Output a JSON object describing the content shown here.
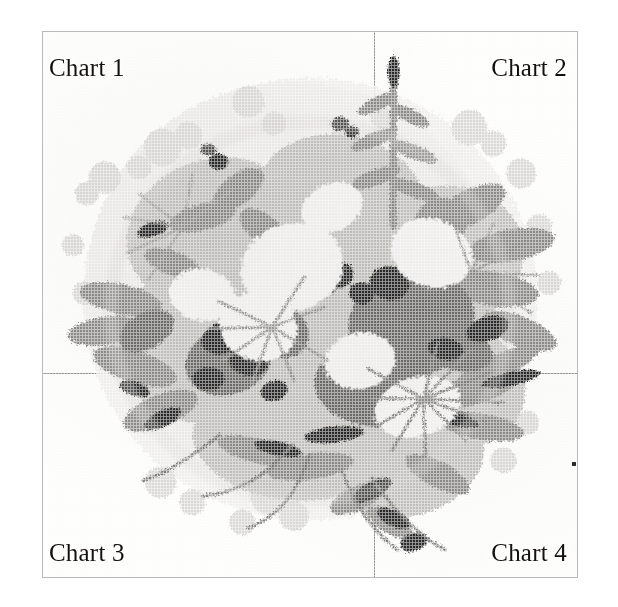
{
  "page": {
    "background_color": "#ffffff",
    "sheet_background_color": "#fdfdfc",
    "border_color": "#b9b9b9",
    "divider_color": "#9a9a9a"
  },
  "sheet": {
    "x": 42,
    "y": 31,
    "width": 536,
    "height": 547
  },
  "dividers": {
    "vertical_x": 331,
    "horizontal_y": 341
  },
  "labels": {
    "chart1": "Chart 1",
    "chart2": "Chart 2",
    "chart3": "Chart 3",
    "chart4": "Chart 4"
  },
  "artwork": {
    "title": "Floral bouquet cross-stitch chart",
    "technique": "counted cross-stitch grid",
    "palette": [
      "#151515",
      "#2e2e2e",
      "#454545",
      "#5e5e5e",
      "#767676",
      "#8e8e8e",
      "#a6a6a6",
      "#bdbdbd",
      "#d2d2d2",
      "#e4e4e4",
      "#f1f1f0"
    ]
  },
  "speck": {
    "x": 572,
    "y": 462,
    "color": "#2b2b2b"
  }
}
